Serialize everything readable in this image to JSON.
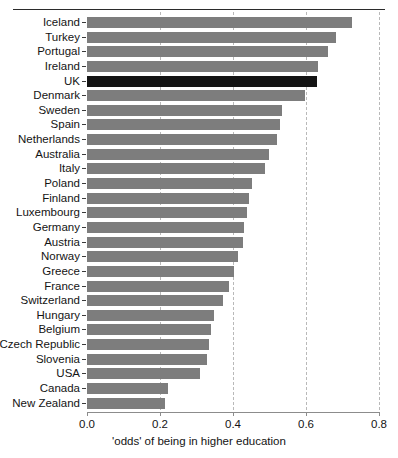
{
  "chart_data": {
    "type": "bar",
    "orientation": "horizontal",
    "title": "",
    "xlabel": "'odds' of being in higher education",
    "ylabel": "",
    "xlim": [
      0.0,
      0.8
    ],
    "xticks": [
      "0.0",
      "0.2",
      "0.4",
      "0.6",
      "0.8"
    ],
    "xtick_values": [
      0.0,
      0.2,
      0.4,
      0.6,
      0.8
    ],
    "grid": "vertical dashed gridlines at 0.2, 0.4, 0.6, 0.8",
    "legend": "none",
    "bar_color": "#7d7d7d",
    "highlight_color": "#141414",
    "highlight_category": "UK",
    "categories": [
      "Iceland",
      "Turkey",
      "Portugal",
      "Ireland",
      "UK",
      "Denmark",
      "Sweden",
      "Spain",
      "Netherlands",
      "Australia",
      "Italy",
      "Poland",
      "Finland",
      "Luxembourg",
      "Germany",
      "Austria",
      "Norway",
      "Greece",
      "France",
      "Switzerland",
      "Hungary",
      "Belgium",
      "Czech Republic",
      "Slovenia",
      "USA",
      "Canada",
      "New Zealand"
    ],
    "values": [
      0.725,
      0.682,
      0.66,
      0.633,
      0.63,
      0.598,
      0.534,
      0.529,
      0.521,
      0.499,
      0.488,
      0.452,
      0.443,
      0.438,
      0.43,
      0.427,
      0.414,
      0.404,
      0.39,
      0.372,
      0.348,
      0.34,
      0.334,
      0.33,
      0.31,
      0.222,
      0.215
    ]
  },
  "axis": {
    "x_label": "'odds' of being in higher education"
  }
}
